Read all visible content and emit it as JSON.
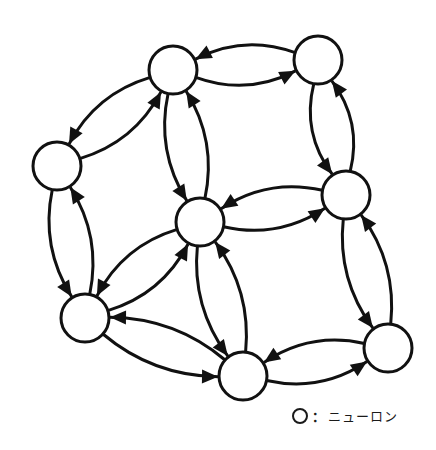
{
  "diagram": {
    "type": "directed-graph",
    "stroke_color": "#111111",
    "fill_color": "#ffffff",
    "nodes": [
      {
        "id": "A",
        "label": "neuron-top-left"
      },
      {
        "id": "B",
        "label": "neuron-top-right"
      },
      {
        "id": "C",
        "label": "neuron-left"
      },
      {
        "id": "D",
        "label": "neuron-center"
      },
      {
        "id": "E",
        "label": "neuron-right"
      },
      {
        "id": "F",
        "label": "neuron-bottom-left"
      },
      {
        "id": "G",
        "label": "neuron-bottom-center"
      },
      {
        "id": "H",
        "label": "neuron-bottom-right"
      }
    ],
    "edges": [
      {
        "from": "A",
        "to": "B"
      },
      {
        "from": "B",
        "to": "A"
      },
      {
        "from": "C",
        "to": "A"
      },
      {
        "from": "A",
        "to": "C"
      },
      {
        "from": "A",
        "to": "D"
      },
      {
        "from": "D",
        "to": "A"
      },
      {
        "from": "B",
        "to": "E"
      },
      {
        "from": "E",
        "to": "B"
      },
      {
        "from": "D",
        "to": "E"
      },
      {
        "from": "E",
        "to": "D"
      },
      {
        "from": "E",
        "to": "H"
      },
      {
        "from": "H",
        "to": "E"
      },
      {
        "from": "H",
        "to": "G"
      },
      {
        "from": "G",
        "to": "H"
      },
      {
        "from": "G",
        "to": "F"
      },
      {
        "from": "F",
        "to": "G"
      },
      {
        "from": "F",
        "to": "D"
      },
      {
        "from": "D",
        "to": "F"
      },
      {
        "from": "D",
        "to": "G"
      },
      {
        "from": "G",
        "to": "D"
      },
      {
        "from": "C",
        "to": "F"
      },
      {
        "from": "F",
        "to": "C"
      }
    ]
  },
  "legend": {
    "symbol": "circle",
    "separator": "：",
    "label": "ニューロン"
  }
}
